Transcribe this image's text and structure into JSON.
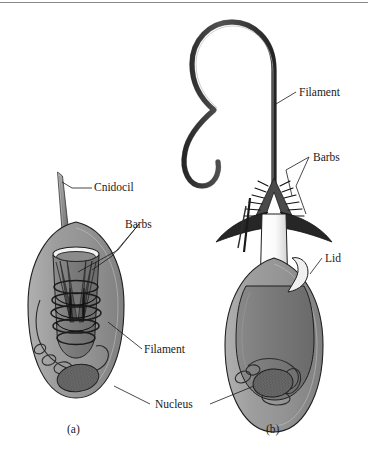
{
  "figure": {
    "background_color": "#ffffff",
    "top_rule_color": "#8a8a8a"
  },
  "colors": {
    "cytoplasm": "#9a9a9a",
    "capsule": "#808080",
    "capsule_dark": "#6e6e6e",
    "outline": "#1a1a1a",
    "lumen": "#ffffff",
    "nucleus": "#6a6a6a",
    "barb_dark": "#2a2a2a",
    "filament_tube": "#4a4a4a",
    "label_text": "#1a1a1a"
  },
  "panels": [
    {
      "id": "a",
      "caption": "(a)",
      "state": "undischarged",
      "labels": [
        {
          "name": "cnidocil",
          "text": "Cnidocil"
        },
        {
          "name": "barbs",
          "text": "Barbs"
        },
        {
          "name": "filament",
          "text": "Filament"
        }
      ]
    },
    {
      "id": "b",
      "caption": "(b)",
      "state": "discharged",
      "labels": [
        {
          "name": "filament",
          "text": "Filament"
        },
        {
          "name": "barbs",
          "text": "Barbs"
        },
        {
          "name": "lid",
          "text": "Lid"
        }
      ]
    }
  ],
  "shared_labels": [
    {
      "name": "nucleus",
      "text": "Nucleus"
    }
  ],
  "label_text": {
    "cnidocil": "Cnidocil",
    "barbs_left": "Barbs",
    "filament_left": "Filament",
    "filament_right": "Filament",
    "barbs_right": "Barbs",
    "lid": "Lid",
    "nucleus": "Nucleus",
    "caption_a": "(a)",
    "caption_b": "(b)"
  }
}
